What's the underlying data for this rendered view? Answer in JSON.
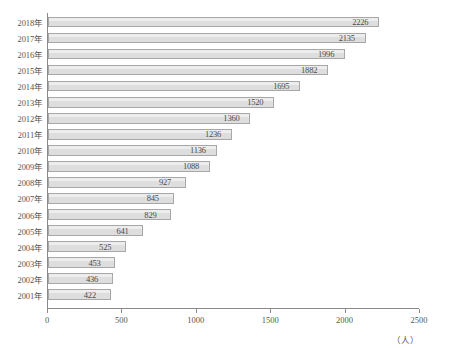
{
  "title": "",
  "chart_data": {
    "type": "bar",
    "orientation": "horizontal",
    "title": "",
    "xlabel": "（人）",
    "ylabel": "",
    "categories": [
      "2018年",
      "2017年",
      "2016年",
      "2015年",
      "2014年",
      "2013年",
      "2012年",
      "2011年",
      "2010年",
      "2009年",
      "2008年",
      "2007年",
      "2006年",
      "2005年",
      "2004年",
      "2003年",
      "2002年",
      "2001年"
    ],
    "values": [
      2226,
      2135,
      1996,
      1882,
      1695,
      1520,
      1360,
      1236,
      1136,
      1088,
      927,
      845,
      829,
      641,
      525,
      453,
      436,
      422
    ],
    "xlim": [
      0,
      2500
    ],
    "xticks": [
      0,
      500,
      1000,
      1500,
      2000,
      2500
    ],
    "xtick_labels": [
      "0",
      "500",
      "1000",
      "1500",
      "2000",
      "2500"
    ],
    "grid": false,
    "legend": null,
    "bar_fill_color": "#dedede",
    "bar_border_color": "#a7a7a7",
    "axis_color": "#8a8a8a",
    "label_color": "#4b4b4b"
  },
  "axis": {
    "unit": "（人）"
  }
}
